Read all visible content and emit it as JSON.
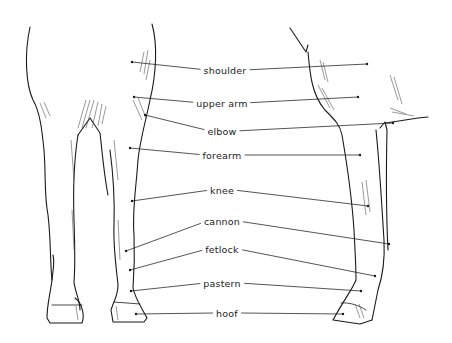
{
  "colors": {
    "ink": "#1a1a1a",
    "background": "#ffffff"
  },
  "labels": [
    {
      "id": "shoulder",
      "text": "shoulder",
      "x": 225,
      "y": 70,
      "left": [
        132,
        62
      ],
      "right": [
        367,
        64
      ]
    },
    {
      "id": "upper-arm",
      "text": "upper arm",
      "x": 222,
      "y": 103,
      "left": [
        134,
        97
      ],
      "right": [
        358,
        97
      ]
    },
    {
      "id": "elbow",
      "text": "elbow",
      "x": 222,
      "y": 131,
      "left": [
        145,
        115
      ],
      "right": [
        393,
        123
      ]
    },
    {
      "id": "forearm",
      "text": "forearm",
      "x": 222,
      "y": 155,
      "left": [
        130,
        148
      ],
      "right": [
        360,
        155
      ]
    },
    {
      "id": "knee",
      "text": "knee",
      "x": 222,
      "y": 190,
      "left": [
        132,
        201
      ],
      "right": [
        368,
        206
      ]
    },
    {
      "id": "cannon",
      "text": "cannon",
      "x": 222,
      "y": 221,
      "left": [
        126,
        251
      ],
      "right": [
        389,
        244
      ]
    },
    {
      "id": "fetlock",
      "text": "fetlock",
      "x": 222,
      "y": 249,
      "left": [
        130,
        270
      ],
      "right": [
        375,
        276
      ]
    },
    {
      "id": "pastern",
      "text": "pastern",
      "x": 222,
      "y": 283,
      "left": [
        131,
        291
      ],
      "right": [
        361,
        291
      ]
    },
    {
      "id": "hoof",
      "text": "hoof",
      "x": 227,
      "y": 313,
      "left": [
        136,
        314
      ],
      "right": [
        343,
        314
      ]
    }
  ]
}
